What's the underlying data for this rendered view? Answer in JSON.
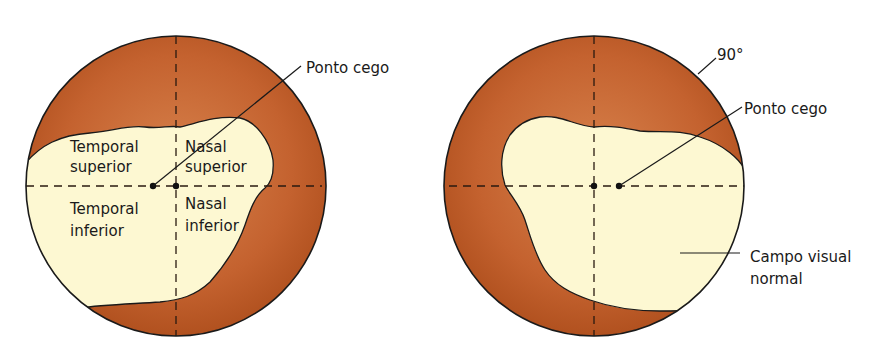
{
  "figure": {
    "colors": {
      "outer_field": "#c4622f",
      "outer_field_dark": "#b1511f",
      "outer_field_light": "#d8834d",
      "visual_field": "#fdf8d2",
      "outline": "#1a1a1a"
    }
  },
  "left_diagram": {
    "quadrants": {
      "temporal_superior_1": "Temporal",
      "temporal_superior_2": "superior",
      "nasal_superior_1": "Nasal",
      "nasal_superior_2": "superior",
      "temporal_inferior_1": "Temporal",
      "temporal_inferior_2": "inferior",
      "nasal_inferior_1": "Nasal",
      "nasal_inferior_2": "inferior"
    },
    "blind_spot_label": "Ponto cego"
  },
  "right_diagram": {
    "degree_label": "90°",
    "blind_spot_label": "Ponto cego",
    "normal_field_label_1": "Campo visual",
    "normal_field_label_2": "normal"
  }
}
